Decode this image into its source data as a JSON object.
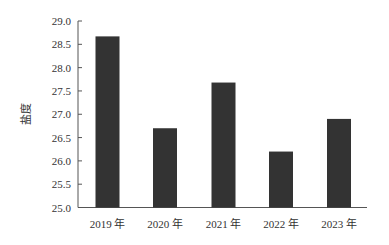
{
  "chart_data": {
    "type": "bar",
    "title": "",
    "xlabel": "",
    "ylabel": "盐度",
    "categories": [
      "2019 年",
      "2020 年",
      "2021 年",
      "2022 年",
      "2023 年"
    ],
    "values": [
      28.67,
      26.7,
      27.68,
      26.2,
      26.9
    ],
    "ylim": [
      25.0,
      29.0
    ],
    "yticks": [
      "25.0",
      "25.5",
      "26.0",
      "26.5",
      "27.0",
      "27.5",
      "28.0",
      "28.5",
      "29.0"
    ],
    "grid": false,
    "legend": null,
    "bar_color": "#333333",
    "axis_color": "#555555"
  }
}
